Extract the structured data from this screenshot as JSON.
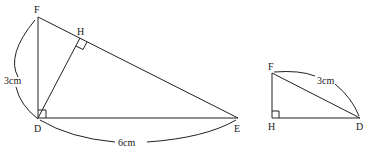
{
  "figure_left": {
    "points": {
      "F": "F",
      "H": "H",
      "D": "D",
      "E": "E"
    },
    "labels": {
      "side_FD": "3cm",
      "side_DE": "6cm"
    },
    "right_angles": [
      "FDE",
      "DHF"
    ]
  },
  "figure_right": {
    "points": {
      "F": "F",
      "H": "H",
      "D": "D"
    },
    "labels": {
      "side_FD": "3cm"
    },
    "right_angles": [
      "FHD"
    ]
  },
  "colors": {
    "stroke": "#222222",
    "background": "#ffffff"
  }
}
